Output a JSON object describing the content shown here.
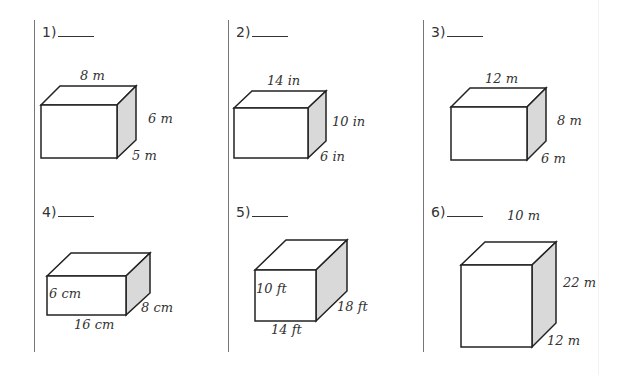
{
  "problems": [
    {
      "number": "1)",
      "dims": {
        "length": "8",
        "height": "6",
        "width": "5"
      },
      "unit": "m",
      "labels": {
        "top": "8 m",
        "side": "6 m",
        "depth": "5 m"
      }
    },
    {
      "number": "2)",
      "dims": {
        "length": "14",
        "height": "10",
        "width": "6"
      },
      "unit": "in",
      "labels": {
        "top": "14 in",
        "side": "10 in",
        "depth": "6 in"
      }
    },
    {
      "number": "3)",
      "dims": {
        "length": "12",
        "height": "8",
        "width": "6"
      },
      "unit": "m",
      "labels": {
        "top": "12 m",
        "side": "8 m",
        "depth": "6 m"
      }
    },
    {
      "number": "4)",
      "dims": {
        "length": "16",
        "height": "6",
        "width": "8"
      },
      "unit": "cm",
      "labels": {
        "front_height": "6 cm",
        "bottom": "16 cm",
        "depth": "8 cm"
      }
    },
    {
      "number": "5)",
      "dims": {
        "length": "14",
        "height": "10",
        "width": "18"
      },
      "unit": "ft",
      "labels": {
        "front_height": "10 ft",
        "bottom": "14 ft",
        "depth": "18 ft"
      }
    },
    {
      "number": "6)",
      "dims": {
        "length": "10",
        "height": "22",
        "width": "12"
      },
      "unit": "m",
      "labels": {
        "top": "10 m",
        "side": "22 m",
        "depth": "12 m"
      }
    }
  ],
  "colors": {
    "line": "#222222",
    "shade": "#d9d9d9",
    "divider": "#777777"
  }
}
